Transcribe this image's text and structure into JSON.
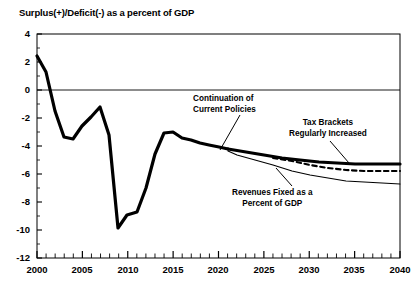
{
  "chart_data": {
    "type": "line",
    "title": "Surplus(+)/Deficit(-) as a percent of GDP",
    "xlabel": "",
    "ylabel": "",
    "xlim": [
      2000,
      2040
    ],
    "ylim": [
      -12,
      4
    ],
    "ytick_labels": [
      "4",
      "2",
      "0",
      "-2",
      "-4",
      "-6",
      "-8",
      "-10",
      "-12"
    ],
    "ytick_values": [
      4,
      2,
      0,
      -2,
      -4,
      -6,
      -8,
      -10,
      -12
    ],
    "xtick_labels": [
      "2000",
      "2005",
      "2010",
      "2015",
      "2020",
      "2025",
      "2030",
      "2035",
      "2040"
    ],
    "xtick_values": [
      2000,
      2005,
      2010,
      2015,
      2020,
      2025,
      2030,
      2035,
      2040
    ],
    "minor_xticks_every": 1,
    "grid": false,
    "zero_line": true,
    "legend_position": "inline-annotations",
    "series": [
      {
        "name": "Continuation of Current Policies",
        "style": "thick-solid",
        "color": "#000000",
        "x": [
          2000,
          2001,
          2002,
          2003,
          2004,
          2005,
          2006,
          2007,
          2008,
          2009,
          2010,
          2011,
          2012,
          2013,
          2014,
          2015,
          2016,
          2017,
          2018,
          2019,
          2020,
          2021,
          2022
        ],
        "values": [
          2.4,
          1.3,
          -1.5,
          -3.4,
          -3.5,
          -2.6,
          -1.9,
          -1.2,
          -3.2,
          -9.9,
          -8.9,
          -8.7,
          -7.0,
          -4.6,
          -3.1,
          -3.0,
          -3.4,
          -3.6,
          -3.8,
          -3.9,
          -4.1,
          -4.3,
          -4.5
        ]
      },
      {
        "name": "Tax Brackets Regularly Increased",
        "style": "thick-solid",
        "color": "#000000",
        "x": [
          2022,
          2024,
          2026,
          2028,
          2030,
          2032,
          2034,
          2036,
          2038,
          2040
        ],
        "values": [
          -4.5,
          -4.7,
          -4.9,
          -5.1,
          -5.3,
          -5.4,
          -5.5,
          -5.6,
          -5.6,
          -5.6
        ]
      },
      {
        "name": "Continuation of Current Policies (dashed)",
        "style": "dashed",
        "color": "#000000",
        "x": [
          2026,
          2028,
          2030,
          2032,
          2034,
          2036,
          2038,
          2040
        ],
        "values": [
          -5.2,
          -5.5,
          -5.8,
          -6.0,
          -6.1,
          -6.2,
          -6.2,
          -6.2
        ]
      },
      {
        "name": "Revenues Fixed as a Percent of GDP",
        "style": "thin-solid",
        "color": "#000000",
        "x": [
          2021,
          2022,
          2024,
          2026,
          2028,
          2030,
          2032,
          2034,
          2036,
          2038,
          2040
        ],
        "values": [
          -4.4,
          -4.8,
          -5.2,
          -5.7,
          -6.1,
          -6.4,
          -6.6,
          -6.8,
          -6.9,
          -7.0,
          -7.0
        ]
      }
    ],
    "annotations": [
      {
        "id": "continuation-of-current-policies",
        "lines": [
          "Continuation of",
          "Current Policies"
        ],
        "leader": true
      },
      {
        "id": "tax-brackets-regularly-increased",
        "lines": [
          "Tax Brackets",
          "Regularly Increased"
        ],
        "leader": true
      },
      {
        "id": "revenues-fixed-as-a-percent-of-gdp",
        "lines": [
          "Revenues Fixed as a",
          "Percent of GDP"
        ],
        "leader": true
      }
    ]
  },
  "axis": {
    "y_labels": [
      {
        "text": "4"
      },
      {
        "text": "2"
      },
      {
        "text": "0"
      },
      {
        "text": "-2"
      },
      {
        "text": "-4"
      },
      {
        "text": "-6"
      },
      {
        "text": "-8"
      },
      {
        "text": "-10"
      },
      {
        "text": "-12"
      }
    ],
    "x_labels": [
      {
        "text": "2000"
      },
      {
        "text": "2005"
      },
      {
        "text": "2010"
      },
      {
        "text": "2015"
      },
      {
        "text": "2020"
      },
      {
        "text": "2025"
      },
      {
        "text": "2030"
      },
      {
        "text": "2035"
      },
      {
        "text": "2040"
      }
    ]
  },
  "annotations_text": {
    "continuation_line1": "Continuation of",
    "continuation_line2": "Current Policies",
    "taxbrackets_line1": "Tax Brackets",
    "taxbrackets_line2": "Regularly Increased",
    "revenues_line1": "Revenues Fixed as a",
    "revenues_line2": "Percent of GDP"
  },
  "colors": {
    "line": "#000000",
    "axis": "#000000",
    "background": "#ffffff"
  }
}
